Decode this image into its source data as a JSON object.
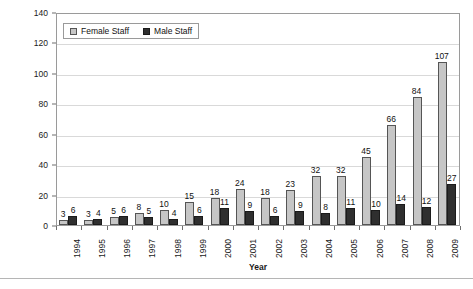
{
  "chart_data": {
    "type": "bar",
    "title": "",
    "xlabel": "Year",
    "ylabel": "Number of Staff",
    "ylim": [
      0,
      140
    ],
    "ytick_step": 20,
    "yticks": [
      0,
      20,
      40,
      60,
      80,
      100,
      120,
      140
    ],
    "grid": true,
    "legend_position": "top-left-inside",
    "categories": [
      "1994",
      "1995",
      "1996",
      "1997",
      "1998",
      "1999",
      "2000",
      "2001",
      "2002",
      "2003",
      "2004",
      "2005",
      "2006",
      "2007",
      "2008",
      "2009"
    ],
    "series": [
      {
        "name": "Female Staff",
        "color": "#c6c6c6",
        "values": [
          3,
          3,
          5,
          8,
          10,
          15,
          18,
          24,
          18,
          23,
          32,
          32,
          45,
          66,
          84,
          107
        ]
      },
      {
        "name": "Male Staff",
        "color": "#2f2f2f",
        "values": [
          6,
          4,
          6,
          5,
          4,
          6,
          11,
          9,
          6,
          9,
          8,
          11,
          10,
          14,
          12,
          27
        ]
      }
    ]
  },
  "legend": {
    "items": [
      {
        "label": "Female Staff",
        "swatch": "female"
      },
      {
        "label": "Male Staff",
        "swatch": "male"
      }
    ]
  },
  "axes": {
    "y_title": "Number of Staff",
    "x_title": "Year"
  }
}
